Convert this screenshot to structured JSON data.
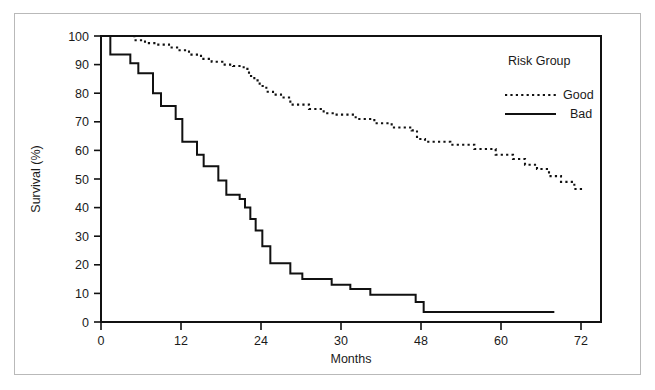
{
  "chart_data": {
    "type": "line",
    "subtype": "kaplan-meier-step",
    "title": "",
    "xlabel": "Months",
    "ylabel": "Survival (%)",
    "xlim": [
      0,
      75
    ],
    "ylim": [
      0,
      100
    ],
    "xticks": [
      0,
      12,
      24,
      30,
      48,
      60,
      72
    ],
    "xtick_labels": [
      "0",
      "12",
      "24",
      "30",
      "48",
      "60",
      "72"
    ],
    "yticks": [
      0,
      10,
      20,
      30,
      40,
      50,
      60,
      70,
      80,
      90,
      100
    ],
    "ytick_labels": [
      "0",
      "10",
      "20",
      "30",
      "40",
      "50",
      "60",
      "70",
      "80",
      "90",
      "100"
    ],
    "grid": false,
    "legend": {
      "title": "Risk Group",
      "position": "top-right",
      "entries": [
        {
          "name": "Good",
          "style": "dotted",
          "color": "#111111"
        },
        {
          "name": "Bad",
          "style": "solid",
          "color": "#111111"
        }
      ]
    },
    "series": [
      {
        "name": "Good",
        "style": "dotted",
        "color": "#111111",
        "x": [
          0,
          3.2,
          5.0,
          6.6,
          8.4,
          10.2,
          11.6,
          13.2,
          15.0,
          16.6,
          18.2,
          19.8,
          21.4,
          22.2,
          23.0,
          23.8,
          24.8,
          25.8,
          27.0,
          28.4,
          31.2,
          33.4,
          35.0,
          38.2,
          41.0,
          43.6,
          46.6,
          47.4,
          48.6,
          52.4,
          56.0,
          59.2,
          61.8,
          63.6,
          65.4,
          67.2,
          69.0,
          71.0,
          72.0
        ],
        "y": [
          100,
          100,
          98.5,
          97.5,
          97.0,
          96.0,
          95.0,
          93.5,
          92.0,
          91.0,
          90.0,
          89.5,
          88.5,
          86.0,
          84.5,
          82.5,
          80.5,
          79.5,
          78.5,
          76.0,
          74.5,
          73.0,
          72.5,
          71.0,
          69.5,
          68.0,
          67.0,
          64.0,
          63.0,
          62.0,
          60.5,
          58.5,
          57.0,
          55.0,
          53.5,
          51.0,
          49.0,
          46.5,
          45.0
        ]
      },
      {
        "name": "Bad",
        "style": "solid",
        "color": "#111111",
        "x": [
          0,
          1.4,
          3.0,
          4.4,
          5.6,
          6.6,
          7.8,
          9.0,
          10.2,
          11.2,
          12.2,
          13.2,
          14.4,
          15.4,
          16.4,
          17.6,
          18.8,
          19.8,
          20.8,
          21.6,
          22.4,
          23.2,
          24.2,
          25.4,
          26.8,
          28.4,
          30.2,
          32.2,
          34.6,
          37.4,
          40.4,
          43.6,
          47.2,
          48.4,
          57.0,
          68.0
        ],
        "y": [
          100,
          93.5,
          93.5,
          90.5,
          87.0,
          87.0,
          80.0,
          75.5,
          75.5,
          71.0,
          63.0,
          63.0,
          58.5,
          54.5,
          54.5,
          49.5,
          44.5,
          44.5,
          43.0,
          40.0,
          36.0,
          32.0,
          26.5,
          20.5,
          20.5,
          17.0,
          15.0,
          15.0,
          13.0,
          11.5,
          9.5,
          9.5,
          7.0,
          3.5,
          3.5,
          3.5
        ]
      }
    ]
  },
  "axes": {
    "y_title": "Survival (%)",
    "x_title": "Months",
    "y_labels": [
      "100",
      "90",
      "80",
      "70",
      "60",
      "50",
      "40",
      "30",
      "20",
      "10",
      "0"
    ],
    "x_labels": [
      "0",
      "12",
      "24",
      "30",
      "48",
      "60",
      "72"
    ]
  },
  "legend": {
    "title": "Risk Group",
    "good_label": "Good",
    "bad_label": "Bad"
  },
  "colors": {
    "ink": "#111111",
    "frame": "#b9b9b9",
    "background": "#ffffff"
  }
}
